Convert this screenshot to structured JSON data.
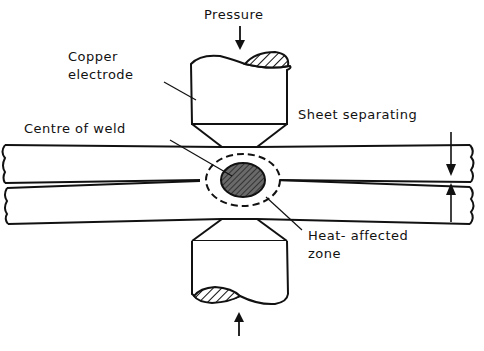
{
  "diagram": {
    "type": "spot-welding-cross-section",
    "labels": {
      "pressure": "Pressure",
      "copper_electrode_line1": "Copper",
      "copper_electrode_line2": "electrode",
      "centre_of_weld": "Centre of weld",
      "sheet_separating": "Sheet separating",
      "heat_affected_line1": "Heat- affected",
      "heat_affected_line2": "zone"
    },
    "colors": {
      "ink": "#111111",
      "background": "#ffffff",
      "weld_fill": "#555555"
    }
  }
}
